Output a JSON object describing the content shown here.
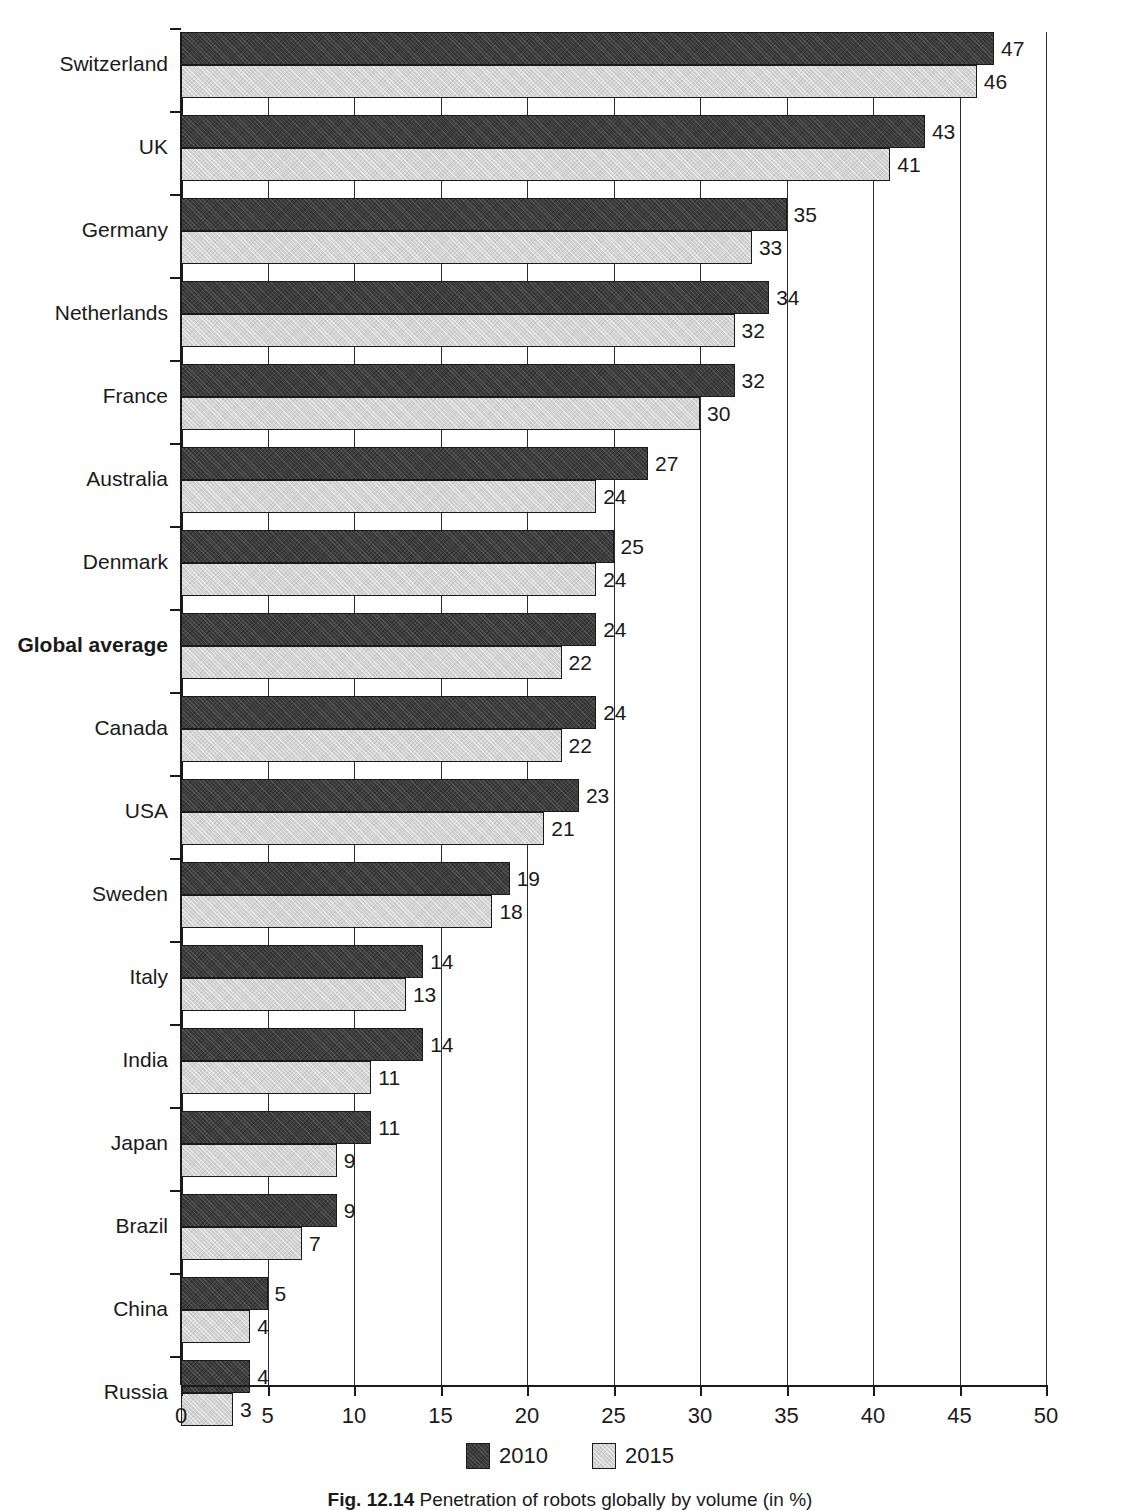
{
  "chart_data": {
    "type": "bar",
    "orientation": "horizontal",
    "title": "",
    "xlabel": "",
    "ylabel": "",
    "xlim": [
      0,
      50
    ],
    "xticks": [
      0,
      5,
      10,
      15,
      20,
      25,
      30,
      35,
      40,
      45,
      50
    ],
    "xtick_labels": [
      "0",
      "5",
      "10",
      "15",
      "20",
      "25",
      "30",
      "35",
      "40",
      "45",
      "50"
    ],
    "grid": true,
    "grid_axis": "x",
    "legend_position": "bottom-center",
    "categories": [
      "Switzerland",
      "UK",
      "Germany",
      "Netherlands",
      "France",
      "Australia",
      "Denmark",
      "Global average",
      "Canada",
      "USA",
      "Sweden",
      "Italy",
      "India",
      "Japan",
      "Brazil",
      "China",
      "Russia"
    ],
    "highlight_category": "Global average",
    "series": [
      {
        "name": "2010",
        "color": "#3b3b3b",
        "values": [
          47,
          43,
          35,
          34,
          32,
          27,
          25,
          24,
          24,
          23,
          19,
          14,
          14,
          11,
          9,
          5,
          4
        ]
      },
      {
        "name": "2015",
        "color": "#d2d2d2",
        "values": [
          46,
          41,
          33,
          32,
          30,
          24,
          24,
          22,
          22,
          21,
          18,
          13,
          11,
          9,
          7,
          4,
          3
        ]
      }
    ]
  },
  "legend": {
    "items": [
      {
        "label": "2010",
        "swatch": "dark-hatched-swatch"
      },
      {
        "label": "2015",
        "swatch": "light-hatched-swatch"
      }
    ]
  },
  "caption": {
    "figure_number": "Fig. 12.14",
    "text": "Penetration of robots globally by volume (in %)"
  }
}
